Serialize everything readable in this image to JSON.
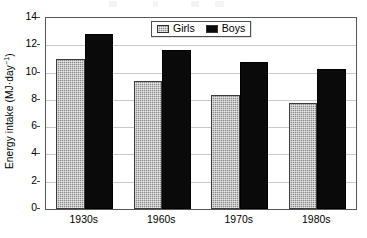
{
  "chart_data": {
    "type": "bar",
    "title": "",
    "xlabel": "",
    "ylabel": "Energy intake (MJ·day⁻¹)",
    "ylabel_main": "Energy intake (MJ·day",
    "ylabel_sup": "−1",
    "ylabel_tail": ")",
    "categories": [
      "1930s",
      "1960s",
      "1970s",
      "1980s"
    ],
    "series": [
      {
        "name": "Girls",
        "values": [
          11.0,
          9.4,
          8.35,
          7.75
        ],
        "color": "#8a8a8a",
        "pattern": "checkered-gray"
      },
      {
        "name": "Boys",
        "values": [
          12.8,
          11.65,
          10.8,
          10.25
        ],
        "color": "#0a0a0a",
        "pattern": "solid-black"
      }
    ],
    "ylim": [
      0,
      14
    ],
    "ytick_values": [
      0,
      2,
      4,
      6,
      8,
      10,
      12,
      14
    ],
    "ytick_labels": [
      "0",
      "2",
      "4",
      "6",
      "8",
      "10",
      "12",
      "14"
    ],
    "grid": "horizontal",
    "legend_position": "top-center-inside",
    "legend_entries": [
      "Girls",
      "Boys"
    ],
    "frame": "box",
    "units": "MJ per day"
  },
  "legend": {
    "items": [
      {
        "label": "Girls",
        "swatch": "girls-swatch"
      },
      {
        "label": "Boys",
        "swatch": "boys-swatch"
      }
    ]
  },
  "axes": {
    "y_title_main": "Energy intake (MJ·day",
    "y_title_sup": "−1",
    "y_title_tail": ")"
  }
}
